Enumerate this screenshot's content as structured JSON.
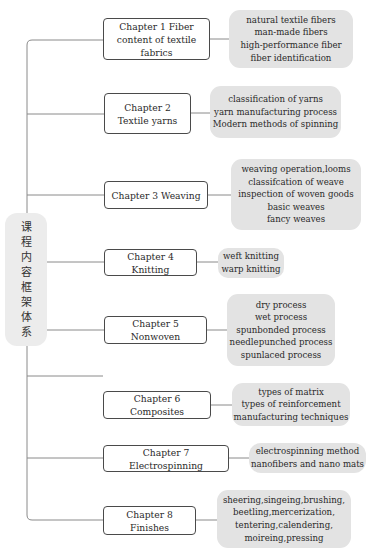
{
  "root": {
    "label": "课程内容框架体系",
    "chars": [
      "课",
      "程",
      "内",
      "容",
      "框",
      "架",
      "体",
      "系"
    ]
  },
  "chapters": [
    {
      "label": "Chapter 1 Fiber content of textile fabrics",
      "items": [
        "natural textile fibers",
        "man-made fibers",
        "high-performance fiber",
        "fiber identification"
      ]
    },
    {
      "label": "Chapter 2 Textile yarns",
      "items": [
        "classification of yarns",
        "yarn manufacturing process",
        "Modern methods of spinning"
      ]
    },
    {
      "label": "Chapter 3 Weaving",
      "items": [
        "weaving operation,looms",
        "classifcation of weave",
        "inspection of woven goods",
        "basic weaves",
        "fancy weaves"
      ]
    },
    {
      "label": "Chapter 4 Knitting",
      "items": [
        "weft knitting",
        "warp knitting"
      ]
    },
    {
      "label": "Chapter 5 Nonwoven",
      "items": [
        "dry process",
        "wet process",
        "spunbonded process",
        "needlepunched process",
        "spunlaced process"
      ]
    },
    {
      "label": "Chapter 6 Composites",
      "items": [
        "types of matrix",
        "types of reinforcement",
        "manufacturing techniques"
      ]
    },
    {
      "label": "Chapter 7 Electrospinning",
      "items": [
        "electrospinning method",
        "nanofibers and nano mats"
      ]
    },
    {
      "label": "Chapter 8 Finishes",
      "items": [
        "sheering,singeing,brushing,",
        "beetling,mercerization,",
        "tentering,calendering,",
        "moireing,pressing"
      ]
    }
  ],
  "colors": {
    "line": "#8a8a8a",
    "chapter_border": "#4a4a4a",
    "leaf_fill": "#e3e3e3",
    "root_fill": "#ececec"
  }
}
